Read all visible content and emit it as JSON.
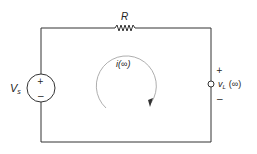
{
  "diagram": {
    "type": "circuit",
    "colors": {
      "wire": "#333333",
      "text": "#222222",
      "loop": "#888888",
      "background": "#ffffff"
    },
    "resistor": {
      "label": "R"
    },
    "source": {
      "label_main": "V",
      "label_sub": "s",
      "plus": "+",
      "minus": "−"
    },
    "output": {
      "label_main": "v",
      "label_sub": "L",
      "label_arg": "(∞)",
      "plus": "+",
      "minus": "−"
    },
    "loop_current": {
      "label": "i(∞)",
      "direction": "clockwise"
    }
  }
}
